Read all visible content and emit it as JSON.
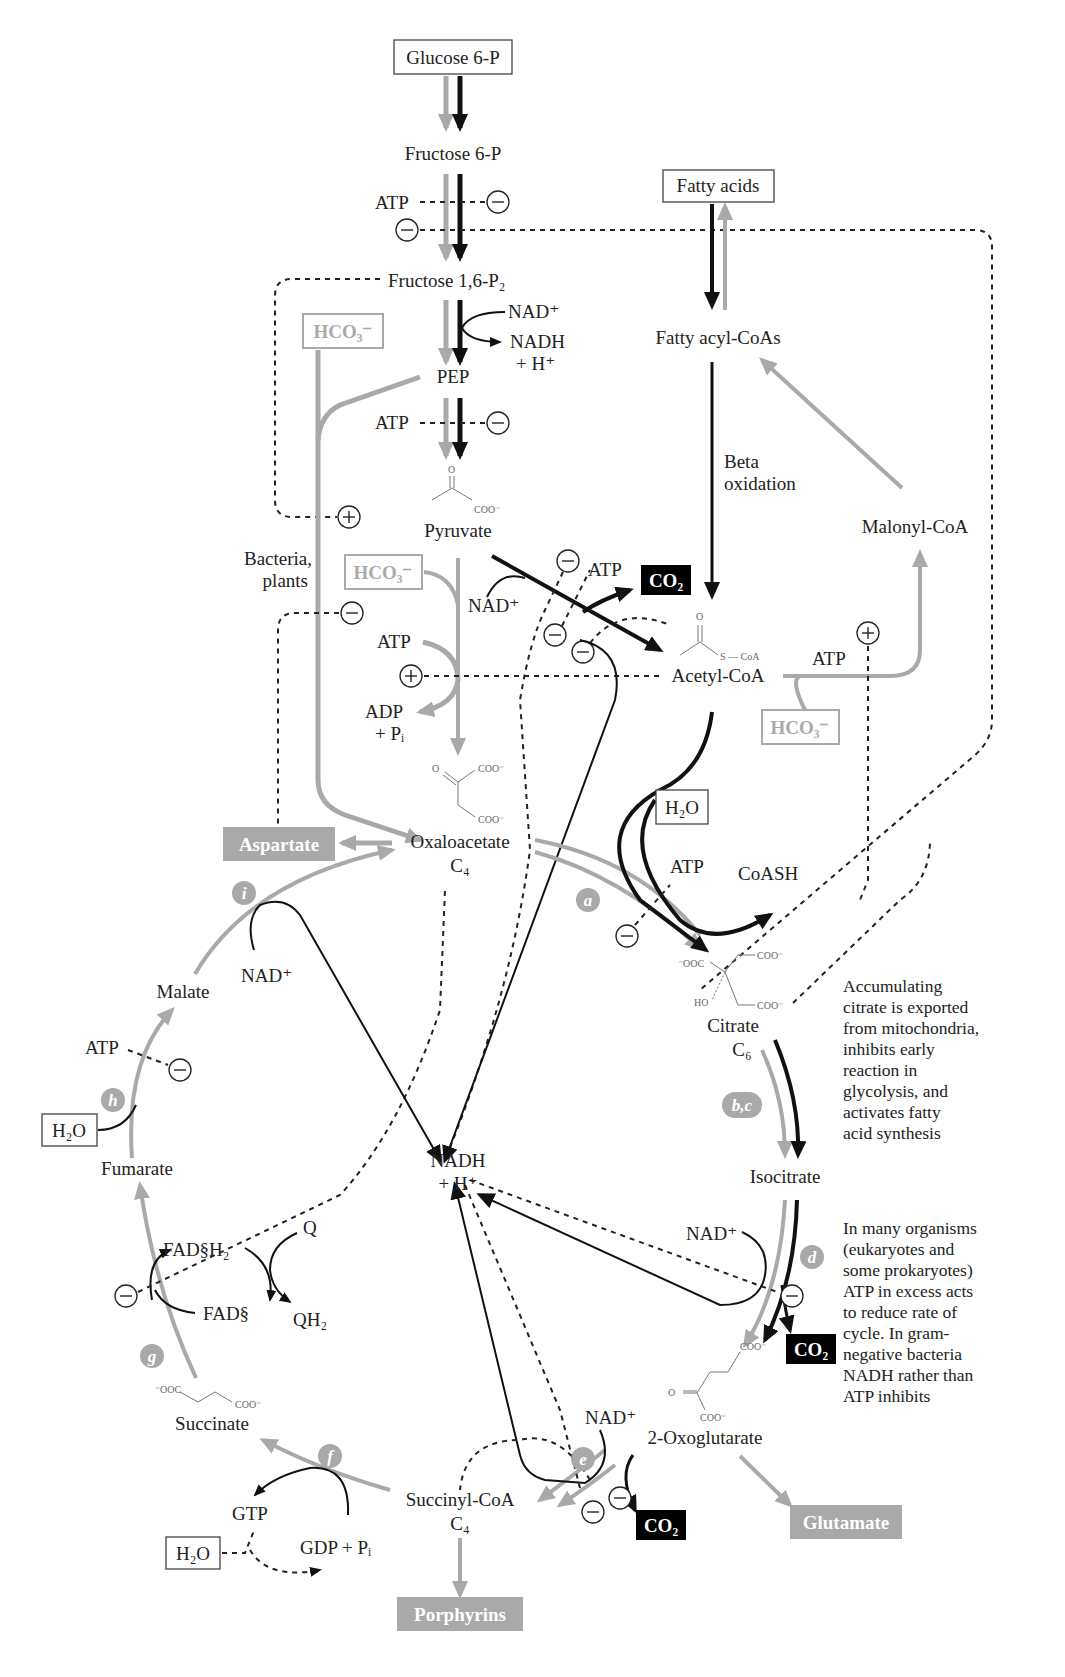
{
  "glycolysis": {
    "glucose6p": "Glucose 6-P",
    "fructose6p": "Fructose 6-P",
    "fructose16p2": "Fructose 1,6-P₂",
    "pep": "PEP",
    "pyruvate": "Pyruvate",
    "atp1": "ATP",
    "atp2": "ATP",
    "nad": "NAD⁺",
    "nadh": "NADH",
    "nadh_h": "+ H⁺"
  },
  "fatty": {
    "fatty_acids": "Fatty acids",
    "fatty_acyl_coas": "Fatty acyl-CoAs",
    "beta1": "Beta",
    "beta2": "oxidation",
    "malonyl_coa": "Malonyl-CoA",
    "atp": "ATP",
    "hco3": "HCO₃⁻"
  },
  "anaplerotic": {
    "hco3_top": "HCO₃⁻",
    "hco3_mid": "HCO₃⁻",
    "bacteria1": "Bacteria,",
    "bacteria2": "plants",
    "atp": "ATP",
    "adp": "ADP",
    "pi": "+ Pᵢ"
  },
  "pdh": {
    "nad": "NAD⁺",
    "atp": "ATP",
    "co2": "CO₂",
    "acetyl_coa": "Acetyl-CoA"
  },
  "tca": {
    "oxaloacetate": "Oxaloacetate",
    "oxaloacetate_c": "C₄",
    "aspartate": "Aspartate",
    "h2o_a": "H₂O",
    "atp_a": "ATP",
    "coash": "CoASH",
    "citrate": "Citrate",
    "citrate_c": "C₆",
    "isocitrate": "Isocitrate",
    "nad_d": "NAD⁺",
    "co2_d": "CO₂",
    "oxoglutarate": "2-Oxoglutarate",
    "glutamate": "Glutamate",
    "nad_e": "NAD⁺",
    "co2_e": "CO₂",
    "succinyl_coa": "Succinyl-CoA",
    "succinyl_c": "C₄",
    "porphyrins": "Porphyrins",
    "gtp": "GTP",
    "gdp": "GDP + Pᵢ",
    "h2o_f": "H₂O",
    "succinate": "Succinate",
    "fadh2": "FAD§H₂",
    "fad": "FAD§",
    "q": "Q",
    "qh2": "QH₂",
    "fumarate": "Fumarate",
    "h2o_h": "H₂O",
    "atp_h": "ATP",
    "malate": "Malate",
    "nad_i": "NAD⁺",
    "nadh": "NADH",
    "nadh_h": "+ H⁺"
  },
  "enzymes": [
    "a",
    "b,c",
    "d",
    "e",
    "f",
    "g",
    "h",
    "i"
  ],
  "notes": {
    "citrate_note": [
      "Accumulating",
      "citrate is exported",
      "from mitochondria,",
      "inhibits early",
      "reaction in",
      "glycolysis, and",
      "activates fatty",
      "acid synthesis"
    ],
    "atp_note": [
      "In many organisms",
      "(eukaryotes and",
      "some prokaryotes)",
      "ATP in excess acts",
      "to reduce rate of",
      "cycle. In gram-",
      "negative bacteria",
      "NADH rather than",
      "ATP inhibits"
    ]
  },
  "structures": {
    "coo": "COO⁻",
    "ooc": "⁻OOC",
    "o": "O",
    "s_coa": "S — CoA",
    "ho": "HO"
  },
  "colors": {
    "black_path": "#111111",
    "gray_path": "#a9a9a9",
    "product_box": "#a9a9a9",
    "co2_box": "#000000"
  }
}
